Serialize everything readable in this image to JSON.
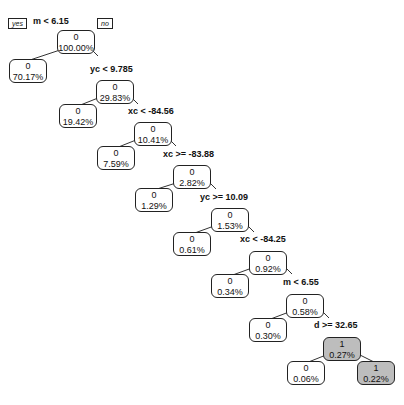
{
  "legend": {
    "yes_label": "yes",
    "no_label": "no"
  },
  "colors": {
    "class0_fill": "#ffffff",
    "class1_fill": "#bdbdbd",
    "border": "#222222"
  },
  "nodes": [
    {
      "id": "n1",
      "cls": "0",
      "pct": "100.00%",
      "split": "m < 6.15"
    },
    {
      "id": "n2",
      "cls": "0",
      "pct": "70.17%"
    },
    {
      "id": "n3",
      "cls": "0",
      "pct": "29.83%",
      "split": "yc < 9.785"
    },
    {
      "id": "n4",
      "cls": "0",
      "pct": "19.42%"
    },
    {
      "id": "n5",
      "cls": "0",
      "pct": "10.41%",
      "split": "xc < -84.56"
    },
    {
      "id": "n6",
      "cls": "0",
      "pct": "7.59%"
    },
    {
      "id": "n7",
      "cls": "0",
      "pct": "2.82%",
      "split": "xc >= -83.88"
    },
    {
      "id": "n8",
      "cls": "0",
      "pct": "1.29%"
    },
    {
      "id": "n9",
      "cls": "0",
      "pct": "1.53%",
      "split": "yc >= 10.09"
    },
    {
      "id": "n10",
      "cls": "0",
      "pct": "0.61%"
    },
    {
      "id": "n11",
      "cls": "0",
      "pct": "0.92%",
      "split": "xc < -84.25"
    },
    {
      "id": "n12",
      "cls": "0",
      "pct": "0.34%"
    },
    {
      "id": "n13",
      "cls": "0",
      "pct": "0.58%",
      "split": "m < 6.55"
    },
    {
      "id": "n14",
      "cls": "0",
      "pct": "0.30%"
    },
    {
      "id": "n15",
      "cls": "1",
      "pct": "0.27%",
      "split": "d >= 32.65"
    },
    {
      "id": "n16",
      "cls": "0",
      "pct": "0.06%"
    },
    {
      "id": "n17",
      "cls": "1",
      "pct": "0.22%"
    }
  ]
}
